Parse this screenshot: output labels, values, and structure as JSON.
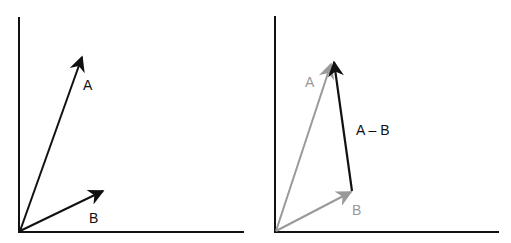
{
  "colors": {
    "black": "#111111",
    "gray": "#999999",
    "background": "#ffffff"
  },
  "left_panel": {
    "labels": {
      "a": "A",
      "b": "B"
    }
  },
  "right_panel": {
    "labels": {
      "a": "A",
      "b": "B",
      "difference": "A – B"
    }
  }
}
